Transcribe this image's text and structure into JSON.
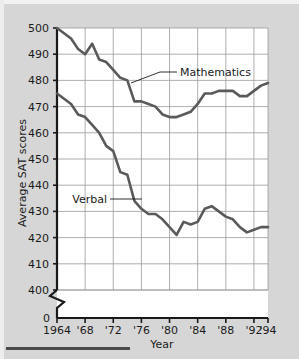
{
  "figure": {
    "background_color": "#d6d6d6",
    "plot_background_color": "#ffffff",
    "grid_color": "#9a9a9a",
    "axis_color": "#1a1a1a",
    "series_color": "#5a5a5a",
    "bottom_rule_color": "#4a4a4a"
  },
  "chart_data": {
    "type": "line",
    "title": "",
    "xlabel": "Year",
    "ylabel": "Average SAT scores",
    "xlim": [
      1964,
      1994
    ],
    "ylim": [
      400,
      500
    ],
    "grid": true,
    "legend_position": "inline-annotations",
    "axis_break": {
      "present": true,
      "from": 0,
      "to": 400,
      "extra_tick": "0"
    },
    "ytick_labels": [
      "500",
      "490",
      "480",
      "470",
      "460",
      "450",
      "440",
      "430",
      "420",
      "410",
      "400",
      "0"
    ],
    "ytick_values": [
      500,
      490,
      480,
      470,
      460,
      450,
      440,
      430,
      420,
      410,
      400
    ],
    "xtick_labels": [
      "1964",
      "'68",
      "'72",
      "'76",
      "'80",
      "'84",
      "'88",
      "'92",
      "'94"
    ],
    "xtick_values": [
      1964,
      1968,
      1972,
      1976,
      1980,
      1984,
      1988,
      1992,
      1994
    ],
    "x": [
      1964,
      1965,
      1966,
      1967,
      1968,
      1969,
      1970,
      1971,
      1972,
      1973,
      1974,
      1975,
      1976,
      1977,
      1978,
      1979,
      1980,
      1981,
      1982,
      1983,
      1984,
      1985,
      1986,
      1987,
      1988,
      1989,
      1990,
      1991,
      1992,
      1993,
      1994
    ],
    "series": [
      {
        "name": "Mathematics",
        "values": [
          500,
          498,
          496,
          492,
          490,
          494,
          488,
          487,
          484,
          481,
          480,
          472,
          472,
          471,
          470,
          467,
          466,
          466,
          467,
          468,
          471,
          475,
          475,
          476,
          476,
          476,
          474,
          474,
          476,
          478,
          479
        ],
        "annotation": {
          "label": "Mathematics",
          "leader": "angled"
        }
      },
      {
        "name": "Verbal",
        "values": [
          475,
          473,
          471,
          467,
          466,
          463,
          460,
          455,
          453,
          445,
          444,
          434,
          431,
          429,
          429,
          427,
          424,
          421,
          426,
          425,
          426,
          431,
          432,
          430,
          428,
          427,
          424,
          422,
          423,
          424,
          424
        ],
        "annotation": {
          "label": "Verbal",
          "leader": "horizontal"
        }
      }
    ]
  }
}
